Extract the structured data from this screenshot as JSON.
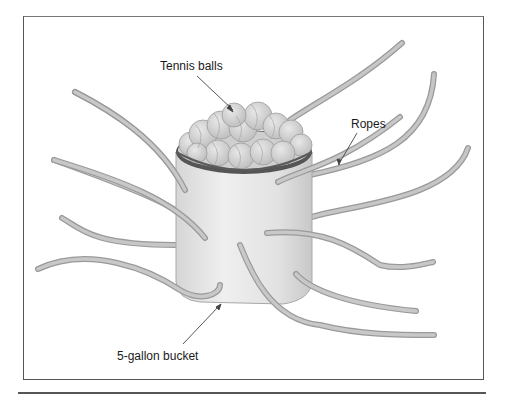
{
  "figure": {
    "labels": {
      "tennis_balls": "Tennis balls",
      "ropes": "Ropes",
      "bucket": "5-gallon bucket"
    },
    "components": [
      "tennis-balls",
      "ropes",
      "5-gallon-bucket"
    ],
    "colors": {
      "rope": "#b9b9b9",
      "rope_edge": "#8e8e8e",
      "bucket": "#e6e6e6",
      "bucket_shade": "#cfcfcf",
      "ball": "#d4d4d4",
      "frame": "#555555"
    }
  }
}
